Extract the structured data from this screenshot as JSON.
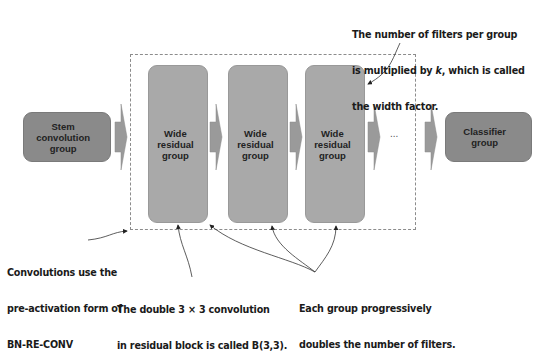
{
  "diagram": {
    "stem": {
      "label": "Stem convolution group",
      "lines": [
        "Stem",
        "convolution",
        "group"
      ]
    },
    "groups": [
      {
        "label": "Wide residual group",
        "lines": [
          "Wide",
          "residual",
          "group"
        ]
      },
      {
        "label": "Wide residual group",
        "lines": [
          "Wide",
          "residual",
          "group"
        ]
      },
      {
        "label": "Wide residual group",
        "lines": [
          "Wide",
          "residual",
          "group"
        ]
      }
    ],
    "ellipsis": "...",
    "classifier": {
      "label": "Classifier group",
      "lines": [
        "Classifier",
        "group"
      ]
    },
    "colors": {
      "stem_fill": "#8a8a8a",
      "group_fill": "#a9a9a9",
      "classifier_fill": "#8a8a8a",
      "arrow_fill": "#9a9a9a",
      "dashed_border": "#8c8c8c"
    }
  },
  "annotations": {
    "width_factor": {
      "line1": "The number of filters per group",
      "line2_pre": "is multiplied by ",
      "line2_k": "k",
      "line2_post": ", which is called",
      "line3": "the width factor."
    },
    "preactivation": {
      "line1": "Convolutions use the",
      "line2": "pre-activation form of",
      "line3": "BN-RE-CONV"
    },
    "block": {
      "line1": "The double 3 × 3 convolution",
      "line2": "in residual block is called B(3,3)."
    },
    "doubling": {
      "line1": "Each group progressively",
      "line2": "doubles the number of filters."
    }
  }
}
